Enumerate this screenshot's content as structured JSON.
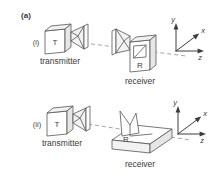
{
  "figure": {
    "panel_label": "(a)",
    "background_color": "#ffffff",
    "line_color": "#555555",
    "dash_color": "#8d8d8d",
    "text_color": "#3a3a3a",
    "rows": [
      {
        "index_label": "(i)",
        "transmitter": {
          "box_label": "T",
          "caption": "transmitter",
          "antenna": "pyramidal-horn"
        },
        "receiver": {
          "box_label": "R",
          "caption": "receiver",
          "antenna": "pyramidal-horn"
        },
        "link": "dashed-line",
        "axes": {
          "y": "y",
          "x": "x",
          "z": "z"
        }
      },
      {
        "index_label": "(ii)",
        "transmitter": {
          "box_label": "T",
          "caption": "transmitter",
          "antenna": "pyramidal-horn"
        },
        "receiver": {
          "box_label": "R",
          "caption": "receiver",
          "antenna": "tapered-slot-on-slab"
        },
        "link": "dashed-line",
        "axes": {
          "y": "y",
          "x": "x",
          "z": "z"
        }
      }
    ]
  }
}
